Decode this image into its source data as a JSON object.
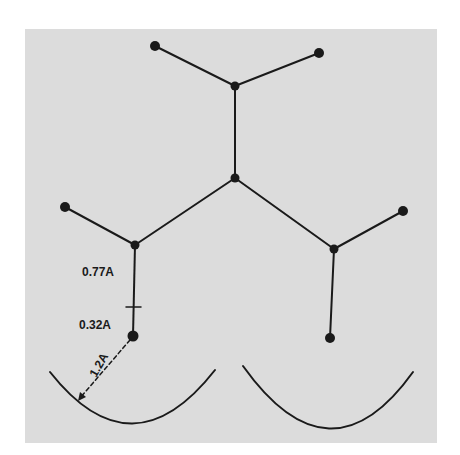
{
  "figure": {
    "background_color": "#dcdcdc",
    "line_color": "#1a1a1a",
    "labels": {
      "bond_length": "0.77A",
      "hydrogen_radius": "0.32A",
      "distance": "1.2A"
    },
    "nodes": [
      {
        "id": "top-left-tip",
        "x": 155,
        "y": 46
      },
      {
        "id": "top-right-tip",
        "x": 319,
        "y": 53
      },
      {
        "id": "top-center",
        "x": 235,
        "y": 86
      },
      {
        "id": "center",
        "x": 235,
        "y": 178
      },
      {
        "id": "left-tip",
        "x": 65,
        "y": 207
      },
      {
        "id": "left-branch",
        "x": 135,
        "y": 245
      },
      {
        "id": "right-tip",
        "x": 403,
        "y": 211
      },
      {
        "id": "right-branch",
        "x": 334,
        "y": 249
      },
      {
        "id": "left-bottom",
        "x": 133,
        "y": 336
      },
      {
        "id": "right-bottom",
        "x": 330,
        "y": 338
      }
    ],
    "arcs": [
      {
        "id": "left-arc",
        "from": [
          50,
          372
        ],
        "to": [
          215,
          370
        ],
        "bottom_y": 424
      },
      {
        "id": "right-arc",
        "from": [
          243,
          366
        ],
        "to": [
          413,
          372
        ],
        "bottom_y": 428
      }
    ]
  }
}
